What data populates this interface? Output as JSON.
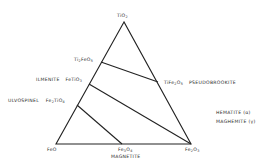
{
  "diagram": {
    "type": "ternary",
    "vertices": {
      "top": "TiO2",
      "bottom_left": "FeO",
      "bottom_right": "Fe2O3"
    },
    "labels": {
      "apex": {
        "base": "TiO",
        "sub": "2"
      },
      "ti2feo5": {
        "p1": "Ti",
        "s1": "2",
        "p2": "FeO",
        "s2": "5"
      },
      "ilmenite_name": "ILMENITE",
      "ilmenite_formula": {
        "p1": "FeTiO",
        "s1": "3"
      },
      "ulvospinel_name": "ULVOSPINEL",
      "ulvospinel_formula": {
        "p1": "Fe",
        "s1": "2",
        "p2": "TiO",
        "s2": "4"
      },
      "pseudobrookite_formula": {
        "p1": "TiFe",
        "s1": "2",
        "p2": "O",
        "s2": "5"
      },
      "pseudobrookite_name": "PSEUDOBROOKITE",
      "feo": "FeO",
      "magnetite_formula": {
        "p1": "Fe",
        "s1": "3",
        "p2": "O",
        "s2": "4"
      },
      "magnetite_name": "MAGNETITE",
      "fe2o3": {
        "p1": "Fe",
        "s1": "2",
        "p2": "O",
        "s2": "3"
      },
      "hematite": "HEMATITE (α)",
      "maghemite": "MAGHEMITE (γ)"
    },
    "tie_lines": [
      {
        "from": "Ti2FeO5",
        "to": "TiFe2O5"
      },
      {
        "from": "FeTiO3",
        "to": "Fe2O3"
      },
      {
        "from": "Fe2TiO4",
        "to": "Fe3O4"
      }
    ],
    "line_color": "#222222"
  }
}
